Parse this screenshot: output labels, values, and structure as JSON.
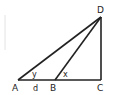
{
  "diagram": {
    "type": "geometry-triangle",
    "points": {
      "A": {
        "label": "A",
        "x": 18,
        "y": 80
      },
      "B": {
        "label": "B",
        "x": 55,
        "y": 80
      },
      "C": {
        "label": "C",
        "x": 101,
        "y": 80
      },
      "D": {
        "label": "D",
        "x": 101,
        "y": 17
      }
    },
    "segments": [
      "AC",
      "CD",
      "AD",
      "BD"
    ],
    "angle_labels": {
      "at_A": "y",
      "at_B": "x"
    },
    "length_labels": {
      "AB": "d"
    },
    "colors": {
      "stroke": "#222222",
      "background": "#ffffff",
      "artifact": "#e4e4e4"
    }
  }
}
